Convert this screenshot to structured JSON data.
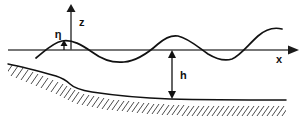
{
  "figure": {
    "labels": {
      "z_axis": "z",
      "x_axis": "x",
      "water_depth": "h",
      "surface_elevation": "η"
    },
    "colors": {
      "background": "#ffffff",
      "axis": "#4a4a4a",
      "curve": "#111111",
      "hatch": "#2b2b2b",
      "label": "#111111"
    },
    "geometry": {
      "still_water_level_y": 50,
      "x_axis_start": 8,
      "x_axis_end": 297,
      "z_axis_x": 71,
      "z_axis_top": 6,
      "wave_path": "M 36,58 C 44,52 52,43 62,41 C 72,39 82,45 92,52 C 104,61 114,63 124,62 C 136,61 148,53 158,44 C 166,37 172,35 178,36 C 188,38 198,47 208,54 C 218,60 226,61 232,59 C 240,56 248,45 258,36 C 266,29 274,27 282,29",
      "bed_path": "M 8,64 C 24,67 42,72 56,76 C 62,78 66,80 70,84 C 74,88 80,90 92,92 C 112,95 140,98 170,99 C 210,100 250,100 286,100",
      "depth_dimension": {
        "x": 172,
        "top_y": 52,
        "bottom_y": 98
      },
      "eta_dimension": {
        "x": 64,
        "top_y": 42,
        "bottom_y": 50
      }
    }
  }
}
